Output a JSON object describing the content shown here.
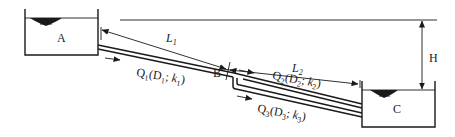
{
  "diagram": {
    "reservoirs": [
      {
        "id": "A",
        "label": "A"
      },
      {
        "id": "C",
        "label": "C"
      }
    ],
    "junction": {
      "label": "B"
    },
    "dimensions": {
      "L1": {
        "main": "L",
        "sub": "1"
      },
      "L2": {
        "main": "L",
        "sub": "2"
      },
      "H": {
        "label": "H"
      }
    },
    "pipes": [
      {
        "id": "pipe-1",
        "q": "Q",
        "q_sub": "1",
        "d": "D",
        "d_sub": "1",
        "k": "k",
        "k_sub": "1"
      },
      {
        "id": "pipe-2",
        "q": "Q",
        "q_sub": "2",
        "d": "D",
        "d_sub": "2",
        "k": "k",
        "k_sub": "2"
      },
      {
        "id": "pipe-3",
        "q": "Q",
        "q_sub": "3",
        "d": "D",
        "d_sub": "3",
        "k": "k",
        "k_sub": "3"
      }
    ],
    "colors": {
      "ink": "#1a1a1a",
      "background": "#ffffff"
    }
  }
}
